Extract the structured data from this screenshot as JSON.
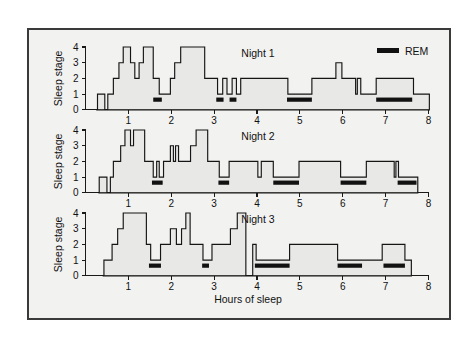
{
  "figure": {
    "background": "#f2f2f0",
    "frame_color": "#3a3a3a",
    "line_color": "#151515",
    "rem_color": "#111111",
    "fill_color": "#e8e8e6"
  },
  "legend": {
    "label": "REM",
    "swatch_name": "rem-swatch"
  },
  "axis": {
    "x_title": "Hours of sleep",
    "y_title": "Sleep stage",
    "x_ticks": [
      "1",
      "2",
      "3",
      "4",
      "5",
      "6",
      "7",
      "8"
    ],
    "x_tick_values": [
      1,
      2,
      3,
      4,
      5,
      6,
      7,
      8
    ],
    "y_ticks": [
      "0",
      "1",
      "2",
      "3",
      "4"
    ],
    "y_tick_values": [
      0,
      1,
      2,
      3,
      4
    ],
    "xlim": [
      0,
      8
    ],
    "ylim": [
      0,
      4
    ]
  },
  "chart_data": {
    "type": "line",
    "title": "",
    "subtitle": "",
    "xlabel": "Hours of sleep",
    "ylabel": "Sleep stage",
    "xlim": [
      0,
      8
    ],
    "ylim": [
      0,
      4
    ],
    "grid": false,
    "legend_position": "top-right",
    "legend": [
      "REM"
    ],
    "style": "step-post hypnogram, three stacked panels",
    "panels": [
      {
        "name": "Night 1",
        "label": "Night 1",
        "steps": [
          [
            0.25,
            0
          ],
          [
            0.28,
            1
          ],
          [
            0.42,
            1
          ],
          [
            0.45,
            0
          ],
          [
            0.5,
            0
          ],
          [
            0.52,
            1
          ],
          [
            0.62,
            1
          ],
          [
            0.65,
            2
          ],
          [
            0.75,
            2
          ],
          [
            0.78,
            3
          ],
          [
            0.85,
            3
          ],
          [
            0.88,
            4
          ],
          [
            1.02,
            4
          ],
          [
            1.05,
            3
          ],
          [
            1.12,
            3
          ],
          [
            1.15,
            2
          ],
          [
            1.22,
            2
          ],
          [
            1.25,
            3
          ],
          [
            1.32,
            3
          ],
          [
            1.35,
            4
          ],
          [
            1.55,
            4
          ],
          [
            1.58,
            2
          ],
          [
            1.7,
            2
          ],
          [
            1.72,
            1
          ],
          [
            1.95,
            1
          ],
          [
            1.98,
            2
          ],
          [
            2.05,
            2
          ],
          [
            2.08,
            3
          ],
          [
            2.18,
            3
          ],
          [
            2.22,
            4
          ],
          [
            2.75,
            4
          ],
          [
            2.78,
            2
          ],
          [
            3.05,
            2
          ],
          [
            3.08,
            1
          ],
          [
            3.18,
            1
          ],
          [
            3.2,
            2
          ],
          [
            3.28,
            2
          ],
          [
            3.3,
            1
          ],
          [
            3.4,
            1
          ],
          [
            3.42,
            2
          ],
          [
            3.5,
            2
          ],
          [
            3.52,
            1
          ],
          [
            3.6,
            1
          ],
          [
            3.62,
            2
          ],
          [
            4.7,
            2
          ],
          [
            4.72,
            1
          ],
          [
            5.25,
            1
          ],
          [
            5.28,
            2
          ],
          [
            5.8,
            2
          ],
          [
            5.84,
            3
          ],
          [
            5.95,
            3
          ],
          [
            5.98,
            2
          ],
          [
            6.28,
            2
          ],
          [
            6.3,
            1
          ],
          [
            6.34,
            2
          ],
          [
            6.38,
            2
          ],
          [
            6.42,
            1
          ],
          [
            6.75,
            1
          ],
          [
            6.78,
            2
          ],
          [
            7.62,
            2
          ],
          [
            7.65,
            1
          ],
          [
            8.0,
            1
          ],
          [
            8.02,
            0
          ]
        ],
        "rem_bars": [
          {
            "start": 1.58,
            "end": 1.78
          },
          {
            "start": 3.05,
            "end": 3.22
          },
          {
            "start": 3.36,
            "end": 3.52
          },
          {
            "start": 4.7,
            "end": 5.28
          },
          {
            "start": 6.78,
            "end": 7.62
          }
        ]
      },
      {
        "name": "Night 2",
        "label": "Night 2",
        "steps": [
          [
            0.3,
            0
          ],
          [
            0.32,
            1
          ],
          [
            0.48,
            1
          ],
          [
            0.5,
            0
          ],
          [
            0.55,
            0
          ],
          [
            0.58,
            1
          ],
          [
            0.62,
            1
          ],
          [
            0.65,
            2
          ],
          [
            0.78,
            2
          ],
          [
            0.82,
            3
          ],
          [
            0.88,
            3
          ],
          [
            0.92,
            4
          ],
          [
            1.02,
            4
          ],
          [
            1.05,
            3
          ],
          [
            1.1,
            3
          ],
          [
            1.12,
            4
          ],
          [
            1.35,
            4
          ],
          [
            1.38,
            2
          ],
          [
            1.55,
            2
          ],
          [
            1.58,
            1
          ],
          [
            1.64,
            1
          ],
          [
            1.66,
            2
          ],
          [
            1.7,
            2
          ],
          [
            1.72,
            1
          ],
          [
            1.8,
            1
          ],
          [
            1.82,
            2
          ],
          [
            1.95,
            2
          ],
          [
            1.98,
            3
          ],
          [
            2.02,
            3
          ],
          [
            2.05,
            2
          ],
          [
            2.08,
            2
          ],
          [
            2.1,
            3
          ],
          [
            2.14,
            3
          ],
          [
            2.17,
            2
          ],
          [
            2.42,
            2
          ],
          [
            2.45,
            3
          ],
          [
            2.55,
            3
          ],
          [
            2.58,
            4
          ],
          [
            2.82,
            4
          ],
          [
            2.85,
            2
          ],
          [
            3.1,
            2
          ],
          [
            3.12,
            1
          ],
          [
            3.32,
            1
          ],
          [
            3.35,
            2
          ],
          [
            4.0,
            2
          ],
          [
            4.02,
            1
          ],
          [
            4.08,
            1
          ],
          [
            4.1,
            2
          ],
          [
            4.35,
            2
          ],
          [
            4.38,
            1
          ],
          [
            4.95,
            1
          ],
          [
            4.98,
            2
          ],
          [
            5.92,
            2
          ],
          [
            5.95,
            1
          ],
          [
            6.52,
            1
          ],
          [
            6.55,
            2
          ],
          [
            7.18,
            2
          ],
          [
            7.2,
            1
          ],
          [
            7.24,
            2
          ],
          [
            7.28,
            2
          ],
          [
            7.3,
            1
          ],
          [
            7.72,
            1
          ],
          [
            7.75,
            0
          ]
        ],
        "rem_bars": [
          {
            "start": 1.55,
            "end": 1.8
          },
          {
            "start": 3.1,
            "end": 3.35
          },
          {
            "start": 4.38,
            "end": 4.98
          },
          {
            "start": 5.95,
            "end": 6.55
          },
          {
            "start": 7.28,
            "end": 7.72
          }
        ]
      },
      {
        "name": "Night 3",
        "label": "Night 3",
        "steps": [
          [
            0.4,
            0
          ],
          [
            0.43,
            1
          ],
          [
            0.58,
            1
          ],
          [
            0.62,
            2
          ],
          [
            0.72,
            2
          ],
          [
            0.75,
            3
          ],
          [
            0.85,
            3
          ],
          [
            0.88,
            4
          ],
          [
            1.38,
            4
          ],
          [
            1.42,
            2
          ],
          [
            1.48,
            2
          ],
          [
            1.52,
            1
          ],
          [
            1.72,
            1
          ],
          [
            1.75,
            2
          ],
          [
            1.95,
            2
          ],
          [
            1.98,
            3
          ],
          [
            2.08,
            3
          ],
          [
            2.12,
            2
          ],
          [
            2.2,
            2
          ],
          [
            2.24,
            3
          ],
          [
            2.3,
            3
          ],
          [
            2.34,
            4
          ],
          [
            2.4,
            4
          ],
          [
            2.44,
            2
          ],
          [
            2.72,
            2
          ],
          [
            2.74,
            1
          ],
          [
            2.92,
            1
          ],
          [
            2.95,
            2
          ],
          [
            3.35,
            2
          ],
          [
            3.38,
            3
          ],
          [
            3.5,
            3
          ],
          [
            3.54,
            4
          ],
          [
            3.7,
            4
          ],
          [
            3.74,
            0
          ],
          [
            3.88,
            0
          ],
          [
            3.9,
            2
          ],
          [
            3.96,
            2
          ],
          [
            3.98,
            1
          ],
          [
            4.72,
            1
          ],
          [
            4.76,
            2
          ],
          [
            5.85,
            2
          ],
          [
            5.88,
            1
          ],
          [
            6.88,
            1
          ],
          [
            6.92,
            2
          ],
          [
            7.42,
            2
          ],
          [
            7.45,
            1
          ],
          [
            7.58,
            1
          ],
          [
            7.6,
            0
          ]
        ],
        "rem_bars": [
          {
            "start": 1.48,
            "end": 1.76
          },
          {
            "start": 2.72,
            "end": 2.88
          },
          {
            "start": 3.95,
            "end": 4.76
          },
          {
            "start": 5.88,
            "end": 6.45
          },
          {
            "start": 6.95,
            "end": 7.45
          }
        ]
      }
    ]
  }
}
